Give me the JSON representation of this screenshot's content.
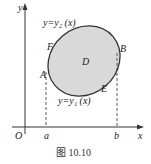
{
  "diagram": {
    "axes": {
      "y_label": "y",
      "x_label": "x",
      "origin_label": "O"
    },
    "curves": {
      "upper": "y=y₂ (x)",
      "lower": "y=y₁ (x)"
    },
    "region_label": "D",
    "points": {
      "A": "A",
      "B": "B",
      "E": "E",
      "F": "F"
    },
    "ticks": {
      "a": "a",
      "b": "b"
    },
    "caption": "图 10.10",
    "fill_color": "#d9d9d9",
    "stroke_color": "#333333"
  }
}
